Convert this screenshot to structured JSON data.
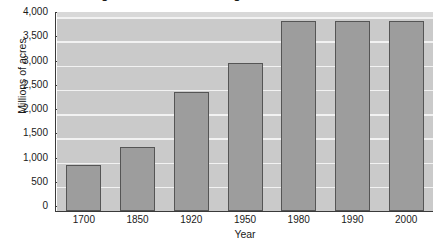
{
  "chart_data": {
    "type": "bar",
    "title": "Changes in Forestland Acreage in the United States",
    "xlabel": "Year",
    "ylabel": "Millions of acres",
    "categories": [
      "1700",
      "1850",
      "1920",
      "1950",
      "1980",
      "1990",
      "2000"
    ],
    "values": [
      950,
      1310,
      2460,
      3050,
      3910,
      3910,
      3910
    ],
    "ylim": [
      0,
      4000
    ],
    "yticks": [
      0,
      500,
      1000,
      1500,
      2000,
      2500,
      3000,
      3500,
      4000
    ],
    "ytick_labels": [
      "0",
      "500",
      "1,000",
      "1,500",
      "2,000",
      "2,500",
      "3,000",
      "3,500",
      "4,000"
    ],
    "grid": true,
    "legend": "none",
    "bar_color": "#9d9d9d",
    "bar_edge_color": "#555555",
    "plot_background": "#cacaca",
    "gridline_color": "#f2f2f2",
    "axis_color": "#3a3a3a",
    "text_color": "#1a1a1a"
  }
}
